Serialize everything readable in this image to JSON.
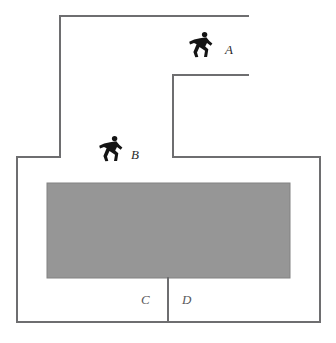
{
  "figure": {
    "kind": "floor-plan-diagram",
    "width": 336,
    "height": 343,
    "background_color": "#ffffff",
    "outline_color": "#6e6e70",
    "outline_width": 2,
    "shaded_area": {
      "name": "shaded-block",
      "fill_color": "#969696",
      "stroke_color": "#828282",
      "x": 47,
      "y": 183,
      "width": 243,
      "height": 95
    },
    "outline_path": "M 60 16 L 248 16 M 173 75 L 248 75 M 173 75 L 173 157 M 60 16 L 60 157 M 17 157 L 60 157 M 173 157 L 320 157 M 17 157 L 17 322 M 320 157 L 320 322 M 17 322 L 320 322",
    "divider_path": "M 168 278 L 168 322",
    "room_labels": [
      {
        "name": "room-label-c",
        "text": "C",
        "x": 141,
        "y": 293
      },
      {
        "name": "room-label-d",
        "text": "D",
        "x": 182,
        "y": 293
      }
    ],
    "runners": [
      {
        "name": "runner-a",
        "label": "A",
        "icon": "running-person-icon",
        "icon_color": "#141414",
        "icon_x": 187,
        "icon_y": 30,
        "label_x": 225,
        "label_y": 43
      },
      {
        "name": "runner-b",
        "label": "B",
        "icon": "running-person-icon",
        "icon_color": "#141414",
        "icon_x": 97,
        "icon_y": 134,
        "label_x": 131,
        "label_y": 148
      }
    ]
  }
}
